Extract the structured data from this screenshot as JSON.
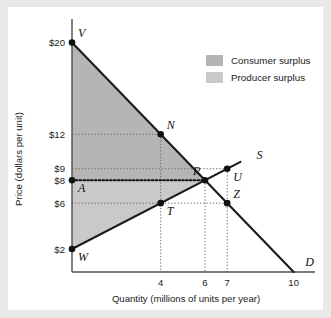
{
  "chart_data": {
    "type": "line",
    "title": "",
    "xlabel": "Quantity (millions of units per year)",
    "ylabel": "Price (dollars per unit)",
    "xlim": [
      0,
      10.6
    ],
    "ylim": [
      0,
      21
    ],
    "grid": false,
    "legend_position": "top-right",
    "x_ticks": [
      "4",
      "6",
      "7",
      "10"
    ],
    "x_tick_values": [
      4,
      6,
      7,
      10
    ],
    "y_ticks": [
      "$20",
      "$12",
      "$9",
      "$8",
      "$6",
      "$2"
    ],
    "y_tick_values": [
      20,
      12,
      9,
      8,
      6,
      2
    ],
    "series": [
      {
        "name": "D",
        "label": "D",
        "type": "demand",
        "points": [
          [
            0,
            20
          ],
          [
            10,
            0
          ]
        ]
      },
      {
        "name": "S",
        "label": "S",
        "type": "supply",
        "points": [
          [
            0,
            2
          ],
          [
            7.6,
            9.6
          ]
        ]
      }
    ],
    "regions": [
      {
        "name": "consumer-surplus",
        "label": "Consumer surplus",
        "color": "#b5b5b5",
        "vertices": [
          [
            0,
            20
          ],
          [
            6,
            8
          ],
          [
            0,
            8
          ]
        ]
      },
      {
        "name": "producer-surplus",
        "label": "Producer surplus",
        "color": "#c9c9c9",
        "vertices": [
          [
            0,
            2
          ],
          [
            6,
            8
          ],
          [
            0,
            8
          ]
        ]
      }
    ],
    "annotations": [
      {
        "name": "V",
        "label": "V",
        "x": 0,
        "y": 20,
        "dot": true,
        "pos": "above-right"
      },
      {
        "name": "N",
        "label": "N",
        "x": 4,
        "y": 12,
        "dot": true,
        "pos": "above-right"
      },
      {
        "name": "R",
        "label": "R",
        "x": 6,
        "y": 8,
        "dot": true,
        "pos": "above-left"
      },
      {
        "name": "U",
        "label": "U",
        "x": 7,
        "y": 9,
        "dot": true,
        "pos": "below-right"
      },
      {
        "name": "Z",
        "label": "Z",
        "x": 7,
        "y": 6,
        "dot": true,
        "pos": "above-right"
      },
      {
        "name": "T",
        "label": "T",
        "x": 4,
        "y": 6,
        "dot": true,
        "pos": "below-right"
      },
      {
        "name": "A",
        "label": "A",
        "x": 0,
        "y": 8,
        "dot": true,
        "pos": "below-right"
      },
      {
        "name": "W",
        "label": "W",
        "x": 0,
        "y": 2,
        "dot": true,
        "pos": "below-right"
      },
      {
        "name": "S",
        "label": "S",
        "x": 8.1,
        "y": 10.1,
        "dot": false,
        "pos": "curve-end"
      },
      {
        "name": "D",
        "label": "D",
        "x": 10.3,
        "y": 0.75,
        "dot": false,
        "pos": "curve-end"
      }
    ],
    "guide_lines": [
      {
        "name": "price-12-to-N",
        "from": [
          0,
          12
        ],
        "to": [
          4,
          12
        ],
        "style": "dotted"
      },
      {
        "name": "qty-4-to-N",
        "from": [
          4,
          12
        ],
        "to": [
          4,
          0
        ],
        "style": "dotted"
      },
      {
        "name": "price-9-to-U",
        "from": [
          0,
          9
        ],
        "to": [
          7,
          9
        ],
        "style": "dotted"
      },
      {
        "name": "price-8-to-R",
        "from": [
          0,
          8
        ],
        "to": [
          6,
          8
        ],
        "style": "dotted-bold"
      },
      {
        "name": "price-6-to-Z",
        "from": [
          0,
          6
        ],
        "to": [
          7,
          6
        ],
        "style": "dotted"
      },
      {
        "name": "qty-6-to-R",
        "from": [
          6,
          8
        ],
        "to": [
          6,
          0
        ],
        "style": "dotted"
      },
      {
        "name": "qty-7-to-U",
        "from": [
          7,
          9
        ],
        "to": [
          7,
          0
        ],
        "style": "dotted"
      }
    ]
  },
  "legend": {
    "items": [
      {
        "label": "Consumer surplus",
        "color": "#b5b5b5"
      },
      {
        "label": "Producer surplus",
        "color": "#c9c9c9"
      }
    ]
  },
  "axes": {
    "x_title": "Quantity (millions of units per year)",
    "y_title": "Price (dollars per unit)"
  }
}
